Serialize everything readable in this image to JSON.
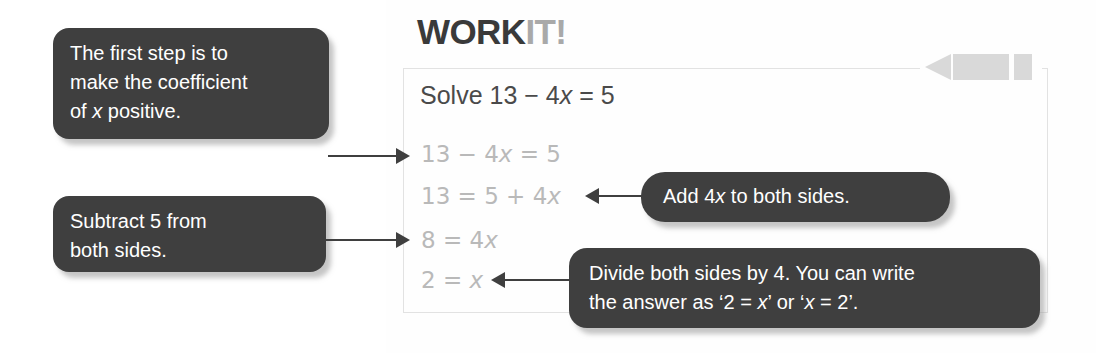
{
  "worksheet": {
    "title_primary": "WORK",
    "title_secondary": "IT!",
    "prompt_prefix": "Solve 13 − 4",
    "prompt_var": "x",
    "prompt_suffix": " = 5",
    "steps": [
      {
        "text": "13 − 4",
        "var": "x",
        "tail": " = 5"
      },
      {
        "text": "13 = 5 + 4",
        "var": "x",
        "tail": ""
      },
      {
        "text": "8 = 4",
        "var": "x",
        "tail": ""
      },
      {
        "text": "2 = ",
        "var": "x",
        "tail": ""
      }
    ]
  },
  "callouts": {
    "first_step": {
      "line1": "The first step is to",
      "line2": "make the coefficient",
      "line3_prefix": "of ",
      "line3_var": "x",
      "line3_suffix": " positive."
    },
    "subtract": {
      "line1": "Subtract 5 from",
      "line2": "both sides."
    },
    "add": {
      "prefix": "Add 4",
      "var": "x",
      "suffix": " to both sides."
    },
    "divide": {
      "line1": "Divide both sides by 4. You can write",
      "line2_a": "the answer as ‘2 = ",
      "line2_var1": "x",
      "line2_b": "’ or ‘",
      "line2_var2": "x",
      "line2_c": " = 2’."
    }
  },
  "icons": {
    "pencil": "pencil-icon"
  },
  "colors": {
    "callout_bg": "#3f3f3f",
    "callout_text": "#ffffff",
    "title_primary": "#3a3a3a",
    "title_secondary": "#a9a9a9",
    "step_text": "#b9b9b9",
    "prompt_text": "#4a4a4a",
    "panel_border": "#e2e2e2",
    "pencil": "#d9d9d9"
  }
}
